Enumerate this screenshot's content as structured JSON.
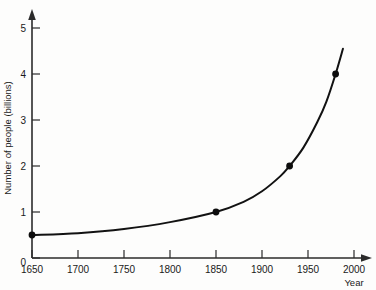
{
  "chart_data": {
    "type": "line",
    "title": "",
    "subtitle": "",
    "xlabel": "Year",
    "ylabel": "Number of people (billions)",
    "xlim": [
      1650,
      2010
    ],
    "ylim": [
      0,
      5.4
    ],
    "grid": false,
    "legend": null,
    "x_ticks": [
      1650,
      1700,
      1750,
      1800,
      1850,
      1900,
      1950,
      2000
    ],
    "x_tick_labels": [
      "1650",
      "1700",
      "1750",
      "1800",
      "1850",
      "1900",
      "1950",
      "2000"
    ],
    "y_ticks": [
      0,
      1,
      2,
      3,
      4,
      5
    ],
    "y_tick_labels": [
      "0",
      "1",
      "2",
      "3",
      "4",
      "5"
    ],
    "markers": [
      {
        "x": 1650,
        "y": 0.5
      },
      {
        "x": 1850,
        "y": 1.0
      },
      {
        "x": 1930,
        "y": 2.0
      },
      {
        "x": 1980,
        "y": 4.0
      }
    ],
    "curve": [
      {
        "x": 1650,
        "y": 0.5
      },
      {
        "x": 1700,
        "y": 0.54
      },
      {
        "x": 1750,
        "y": 0.63
      },
      {
        "x": 1800,
        "y": 0.78
      },
      {
        "x": 1850,
        "y": 1.0
      },
      {
        "x": 1880,
        "y": 1.22
      },
      {
        "x": 1900,
        "y": 1.45
      },
      {
        "x": 1920,
        "y": 1.78
      },
      {
        "x": 1930,
        "y": 2.0
      },
      {
        "x": 1945,
        "y": 2.4
      },
      {
        "x": 1960,
        "y": 2.95
      },
      {
        "x": 1970,
        "y": 3.4
      },
      {
        "x": 1980,
        "y": 4.0
      },
      {
        "x": 1988,
        "y": 4.55
      }
    ],
    "series": [
      {
        "name": "World population",
        "x": [
          1650,
          1850,
          1930,
          1980
        ],
        "values": [
          0.5,
          1.0,
          2.0,
          4.0
        ]
      }
    ],
    "annotations": [],
    "axes_style": {
      "x_axis_arrow": true,
      "y_axis_arrow": true,
      "curve_color": "#121212",
      "marker_color": "#0d0d0d",
      "axis_color": "#2b2b2b",
      "background": "#fdfdfc"
    }
  }
}
